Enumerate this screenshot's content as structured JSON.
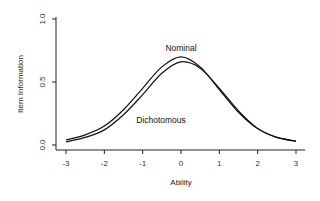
{
  "chart_data": {
    "type": "line",
    "title": "",
    "xlabel": "Ability",
    "ylabel": "Item Information",
    "xlim": [
      -3,
      3
    ],
    "ylim": [
      0,
      1.0
    ],
    "xticks": [
      "-3",
      "-2",
      "-1",
      "0",
      "1",
      "2",
      "3"
    ],
    "yticks": [
      "0.0",
      "0.5",
      "1.0"
    ],
    "grid": false,
    "legend": "none (direct curve annotations)",
    "annotations": [
      {
        "text": "Nominal",
        "x": 0.0,
        "y": 0.76
      },
      {
        "text": "Dichotomous",
        "x": -1.0,
        "y": 0.23
      }
    ],
    "x": [
      -3,
      -2.5,
      -2,
      -1.5,
      -1,
      -0.5,
      0,
      0.5,
      1,
      1.5,
      2,
      2.5,
      3
    ],
    "series": [
      {
        "name": "Nominal",
        "values": [
          0.04,
          0.08,
          0.15,
          0.28,
          0.45,
          0.62,
          0.7,
          0.62,
          0.44,
          0.26,
          0.13,
          0.06,
          0.03
        ],
        "color": "#111111"
      },
      {
        "name": "Dichotomous",
        "values": [
          0.025,
          0.06,
          0.12,
          0.24,
          0.4,
          0.57,
          0.66,
          0.61,
          0.45,
          0.27,
          0.13,
          0.06,
          0.03
        ],
        "color": "#111111"
      }
    ]
  },
  "labels": {
    "xlabel": "Ability",
    "ylabel": "Item Information",
    "nominal": "Nominal",
    "dichotomous": "Dichotomous"
  }
}
